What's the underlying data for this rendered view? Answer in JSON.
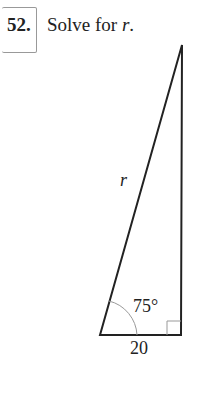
{
  "problem": {
    "number": "52.",
    "instruction_prefix": "Solve for ",
    "variable": "r",
    "instruction_suffix": "."
  },
  "figure": {
    "type": "right-triangle",
    "hypotenuse_label": "r",
    "angle_label": "75°",
    "base_label": "20",
    "right_angle_marker": true
  }
}
